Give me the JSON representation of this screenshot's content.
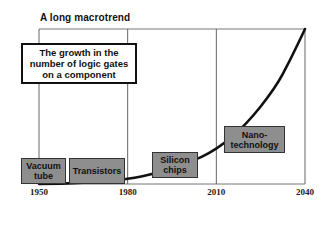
{
  "title": "A long macrotrend",
  "callout": "The growth in the\nnumber of logic gates\non a component",
  "chart_data": {
    "type": "line",
    "title": "A long macrotrend",
    "subtitle": "The growth in the number of logic gates on a component",
    "xlabel": "",
    "ylabel": "",
    "x_ticks": [
      "1950",
      "1980",
      "2010",
      "2040"
    ],
    "xlim": [
      1950,
      2040
    ],
    "grid": "vertical lines at tick years",
    "series": [
      {
        "name": "Logic gates per component (relative, exponential)",
        "x": [
          1950,
          1965,
          1980,
          1990,
          2000,
          2010,
          2020,
          2030,
          2035,
          2040
        ],
        "y": [
          0,
          0.005,
          0.03,
          0.07,
          0.13,
          0.22,
          0.38,
          0.62,
          0.8,
          1.0
        ]
      }
    ],
    "eras": [
      {
        "label": "Vacuum\ntube",
        "year": 1953
      },
      {
        "label": "Transistors",
        "year": 1969
      },
      {
        "label": "Silicon\nchips",
        "year": 2000
      },
      {
        "label": "Nano-\ntechnology",
        "year": 2023
      }
    ]
  },
  "colors": {
    "era_fill": "#8e8e8e",
    "curve": "#111111",
    "grid": "#555555"
  }
}
